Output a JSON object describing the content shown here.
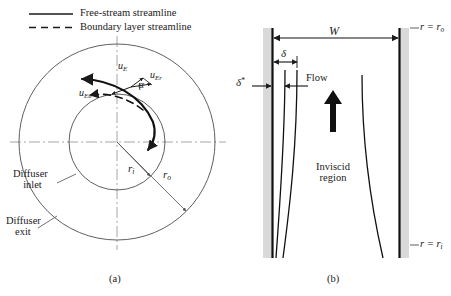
{
  "figure": {
    "captions": {
      "left": "(a)",
      "right": "(b)"
    },
    "colors": {
      "line": "#1a1a1a",
      "thin_line": "#5a5a5a",
      "centerline": "#9a9a9a",
      "wall_fill": "#d9d9d9",
      "background": "#ffffff"
    }
  },
  "legend": {
    "items": [
      {
        "style": "solid",
        "label": "Free-stream streamline"
      },
      {
        "style": "dashed",
        "label": "Boundary layer streamline"
      }
    ]
  },
  "panel_a": {
    "caption": "(a)",
    "description": "Plan view of annular diffuser with inner and outer radii",
    "labels": {
      "diffuser_inlet": "Diffuser\ninlet",
      "diffuser_inlet_line1": "Diffuser",
      "diffuser_inlet_line2": "inlet",
      "diffuser_exit_line1": "Diffuser",
      "diffuser_exit_line2": "exit",
      "inner_radius": "r",
      "inner_radius_sub": "i",
      "outer_radius": "r",
      "outer_radius_sub": "o",
      "velocity": "u",
      "velocity_sub": "E",
      "velocity_radial": "u",
      "velocity_radial_sub": "Er",
      "velocity_tangential": "u",
      "velocity_tangential_sub": "Eθ",
      "angle": "α"
    },
    "geometry": {
      "center_x": 117,
      "center_y": 142,
      "inner_radius_px": 48,
      "outer_radius_px": 98
    }
  },
  "panel_b": {
    "caption": "(b)",
    "description": "Meridional view between diffuser walls showing boundary layers",
    "labels": {
      "width": "W",
      "boundary_layer_thickness": "δ",
      "displacement_thickness": "δ",
      "displacement_thickness_sup": "*",
      "flow": "Flow",
      "inviscid_region_line1": "Inviscid",
      "inviscid_region_line2": "region",
      "outer_radius_eq": "r = r",
      "outer_radius_eq_sub": "o",
      "inner_radius_eq": "r = r",
      "inner_radius_eq_sub": "i"
    },
    "geometry": {
      "left_wall_x": 272,
      "right_wall_x": 400,
      "top_y": 28,
      "bottom_y": 258
    }
  }
}
